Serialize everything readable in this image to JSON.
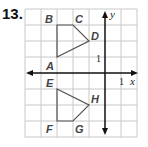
{
  "problem_number": "13.",
  "axes": {
    "x_label": "x",
    "y_label": "y",
    "x_unit_label": "1",
    "y_unit_label": "1"
  },
  "grid": {
    "x_range": [
      -5,
      2
    ],
    "y_range": [
      -4,
      4
    ]
  },
  "shapes": [
    {
      "name": "ABCD",
      "vertices": [
        {
          "label": "A",
          "x": -3,
          "y": 1
        },
        {
          "label": "B",
          "x": -3,
          "y": 3
        },
        {
          "label": "C",
          "x": -2,
          "y": 3
        },
        {
          "label": "D",
          "x": -1,
          "y": 2
        }
      ]
    },
    {
      "name": "EFGH",
      "vertices": [
        {
          "label": "E",
          "x": -3,
          "y": -1
        },
        {
          "label": "F",
          "x": -3,
          "y": -3
        },
        {
          "label": "G",
          "x": -2,
          "y": -3
        },
        {
          "label": "H",
          "x": -1,
          "y": -2
        }
      ]
    }
  ],
  "colors": {
    "grid": "#cccccc",
    "axis": "#111111",
    "shape": "#555555"
  }
}
